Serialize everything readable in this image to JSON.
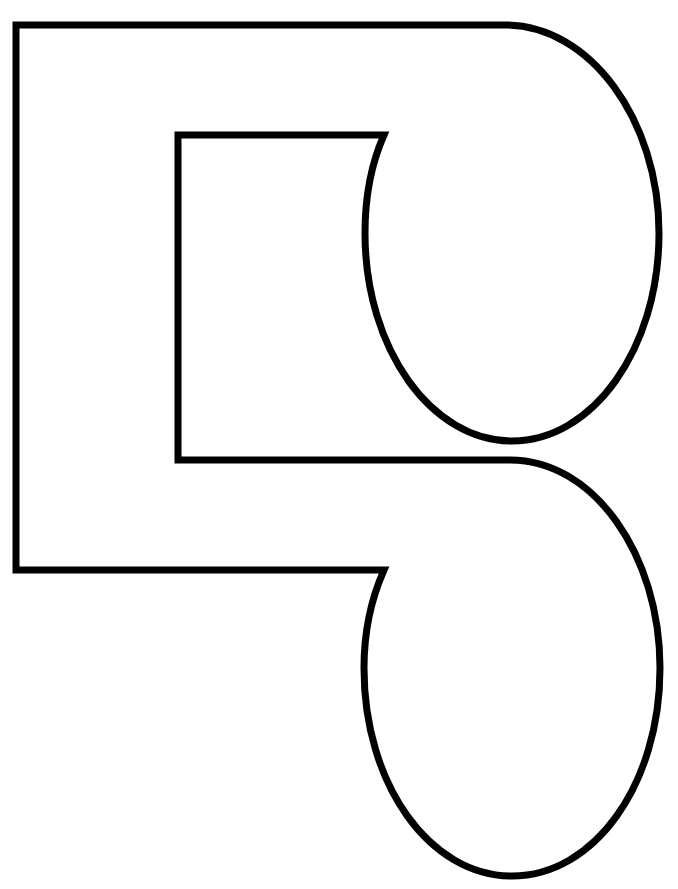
{
  "page": {
    "background": "#ffffff",
    "width": 678,
    "height": 889
  },
  "header": {
    "clipped_caption": ""
  },
  "figure": {
    "stroke_color": "#000000",
    "fill_color": "#ffffff",
    "stroke_width": 7,
    "outline": {
      "outer_left_x": 16,
      "top_y": 25,
      "outer_bottom_y": 570,
      "inner_left_x": 178,
      "inner_top_y": 135,
      "inner_bottom_y": 460,
      "upper_lobe": {
        "cx": 512,
        "cy": 233,
        "rx": 147,
        "ry": 208
      },
      "lower_lobe": {
        "cx": 512,
        "cy": 668,
        "rx": 148,
        "ry": 208
      }
    }
  }
}
